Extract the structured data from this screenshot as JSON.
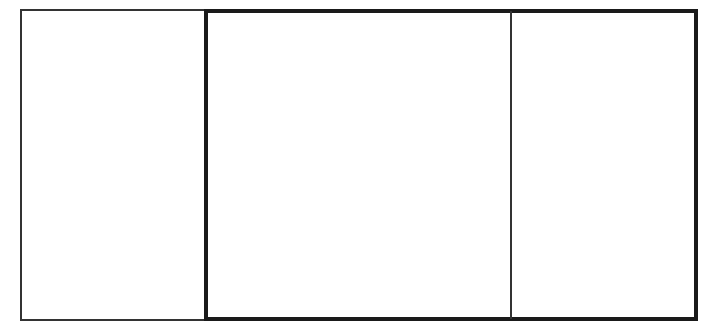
{
  "diagram": {
    "panels": [
      {
        "id": "left",
        "border": "thin",
        "content": ""
      },
      {
        "id": "middle",
        "border": "thick",
        "content": ""
      },
      {
        "id": "right",
        "border": "thick",
        "content": ""
      }
    ],
    "colors": {
      "stroke_thin": "#333333",
      "stroke_thick": "#1a1a1a",
      "background": "#ffffff"
    }
  }
}
